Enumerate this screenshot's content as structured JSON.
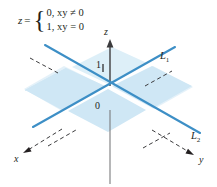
{
  "figure": {
    "title_formula": {
      "lhs": "z",
      "equals": "=",
      "case_1": "0,  xy ≠ 0",
      "case_2": "1,  xy = 0"
    },
    "axes": {
      "z_label": "z",
      "x_label": "x",
      "y_label": "y",
      "origin_label": "0",
      "unit_tick_label": "1"
    },
    "lines": [
      {
        "name": "L-one",
        "label": "L",
        "subscript": "1"
      },
      {
        "name": "L-two",
        "label": "L",
        "subscript": "2"
      }
    ],
    "colors": {
      "plane_fill": "#cfe7f5",
      "plane_fill_light": "#ddeff8",
      "line_blue": "#3d8fc6",
      "axis_gray": "#6d6e71",
      "ink": "#231f20",
      "background": "#ffffff"
    }
  }
}
